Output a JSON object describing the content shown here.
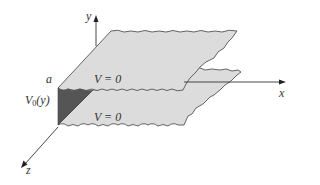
{
  "diagram": {
    "type": "3d-boundary-value-sketch",
    "axes": {
      "x": {
        "label": "x"
      },
      "y": {
        "label": "y"
      },
      "z": {
        "label": "z"
      }
    },
    "labels": {
      "a": "a",
      "top_plate": "V = 0",
      "bottom_plate": "V = 0",
      "end_potential_main": "V",
      "end_potential_sub": "0",
      "end_potential_arg": "(y)"
    },
    "colors": {
      "plate_fill": "#dcdcdc",
      "plate_edge": "#555555",
      "end_face": "#555555",
      "axis": "#333333"
    }
  }
}
